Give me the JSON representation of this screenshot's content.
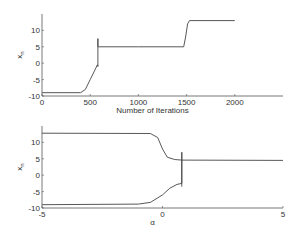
{
  "chart_data": [
    {
      "type": "line",
      "title": "",
      "xlabel": "Number of Iterations",
      "ylabel": "x_n",
      "xlim": [
        0,
        2500
      ],
      "ylim": [
        -10,
        15
      ],
      "xticks": [
        "0",
        "500",
        "1000",
        "1500",
        "2000"
      ],
      "yticks": [
        "-10",
        "-5",
        "0",
        "5",
        "10"
      ],
      "grid": false,
      "series": [
        {
          "name": "x_n",
          "x": [
            0,
            400,
            450,
            500,
            550,
            575,
            580,
            580,
            580,
            600,
            1000,
            1470,
            1490,
            1510,
            1530,
            2000
          ],
          "y": [
            -9,
            -9,
            -8,
            -5,
            -2,
            -0.5,
            -1,
            7.5,
            5,
            5,
            5,
            5,
            8,
            12,
            13,
            13
          ]
        }
      ]
    },
    {
      "type": "line",
      "title": "",
      "xlabel": "α",
      "ylabel": "x_n",
      "xlim": [
        -5,
        5
      ],
      "ylim": [
        -10,
        15
      ],
      "xticks": [
        "-5",
        "0",
        "5"
      ],
      "yticks": [
        "-10",
        "-5",
        "0",
        "5",
        "10"
      ],
      "grid": false,
      "series": [
        {
          "name": "upper branch",
          "x": [
            -5,
            -0.5,
            -0.2,
            0,
            0.2,
            0.5,
            0.8,
            5
          ],
          "y": [
            12.8,
            12.7,
            11.5,
            8,
            5.5,
            4.8,
            4.6,
            4.5
          ]
        },
        {
          "name": "lower branch",
          "x": [
            -5,
            -1,
            -0.5,
            0,
            0.3,
            0.6,
            0.8,
            0.8,
            0.8
          ],
          "y": [
            -9,
            -8.8,
            -8.3,
            -6,
            -4,
            -2.8,
            -2.5,
            7,
            -3.5
          ]
        }
      ]
    }
  ]
}
